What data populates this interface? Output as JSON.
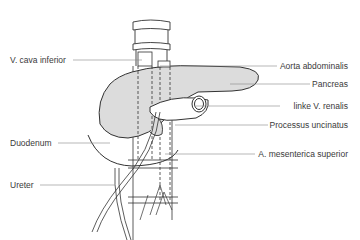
{
  "diagram": {
    "type": "anatomical illustration",
    "colors": {
      "line": "#333333",
      "pancreas_fill": "#dcdcdc",
      "leader_line": "#888888",
      "text": "#3a3a3a"
    },
    "labels_left": [
      {
        "text": "V. cava inferior",
        "x": 10,
        "y": 55
      },
      {
        "text": "Duodenum",
        "x": 10,
        "y": 139
      },
      {
        "text": "Ureter",
        "x": 10,
        "y": 180
      }
    ],
    "labels_right": [
      {
        "text": "Aorta abdominalis",
        "right": 12,
        "y": 62
      },
      {
        "text": "Pancreas",
        "right": 12,
        "y": 79
      },
      {
        "text": "linke V. renalis",
        "right": 12,
        "y": 102
      },
      {
        "text": "Processus uncinatus",
        "right": 12,
        "y": 120
      },
      {
        "text": "A. mesenterica superior",
        "right": 12,
        "y": 149
      }
    ]
  }
}
